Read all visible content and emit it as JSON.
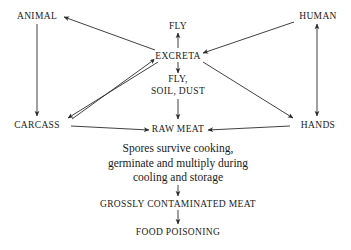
{
  "diagram": {
    "background_color": "#ffffff",
    "line_color": "#2b2b2b",
    "nodes": {
      "animal": "ANIMAL",
      "human": "HUMAN",
      "carcass": "CARCASS",
      "hands": "HANDS",
      "fly_top": "FLY",
      "excreta": "EXCRETA",
      "fly_mid": "FLY,",
      "soil_dust": "SOIL, DUST",
      "raw_meat": "RAW MEAT",
      "contaminated_meat": "GROSSLY CONTAMINATED MEAT",
      "food_poisoning": "FOOD POISONING"
    },
    "note": {
      "line1": "Spores survive cooking,",
      "line2": "germinate and multiply during",
      "line3": "cooling and storage"
    },
    "edges": [
      {
        "from": "EXCRETA",
        "to": "ANIMAL",
        "style": "single"
      },
      {
        "from": "ANIMAL",
        "to": "CARCASS",
        "style": "single"
      },
      {
        "from": "CARCASS",
        "to": "EXCRETA",
        "style": "single"
      },
      {
        "from": "EXCRETA",
        "to": "CARCASS",
        "style": "single"
      },
      {
        "from": "HUMAN",
        "to": "EXCRETA",
        "style": "single"
      },
      {
        "from": "HUMAN",
        "to": "HANDS",
        "style": "double"
      },
      {
        "from": "EXCRETA",
        "to": "HANDS",
        "style": "single"
      },
      {
        "from": "EXCRETA",
        "to": "FLY",
        "style": "single"
      },
      {
        "from": "EXCRETA",
        "to": "FLY, SOIL, DUST",
        "style": "single"
      },
      {
        "from": "FLY, SOIL, DUST",
        "to": "RAW MEAT",
        "style": "single"
      },
      {
        "from": "CARCASS",
        "to": "RAW MEAT",
        "style": "single"
      },
      {
        "from": "HANDS",
        "to": "RAW MEAT",
        "style": "single"
      },
      {
        "from": "RAW MEAT",
        "to": "GROSSLY CONTAMINATED MEAT",
        "style": "single"
      },
      {
        "from": "GROSSLY CONTAMINATED MEAT",
        "to": "FOOD POISONING",
        "style": "single"
      }
    ]
  }
}
